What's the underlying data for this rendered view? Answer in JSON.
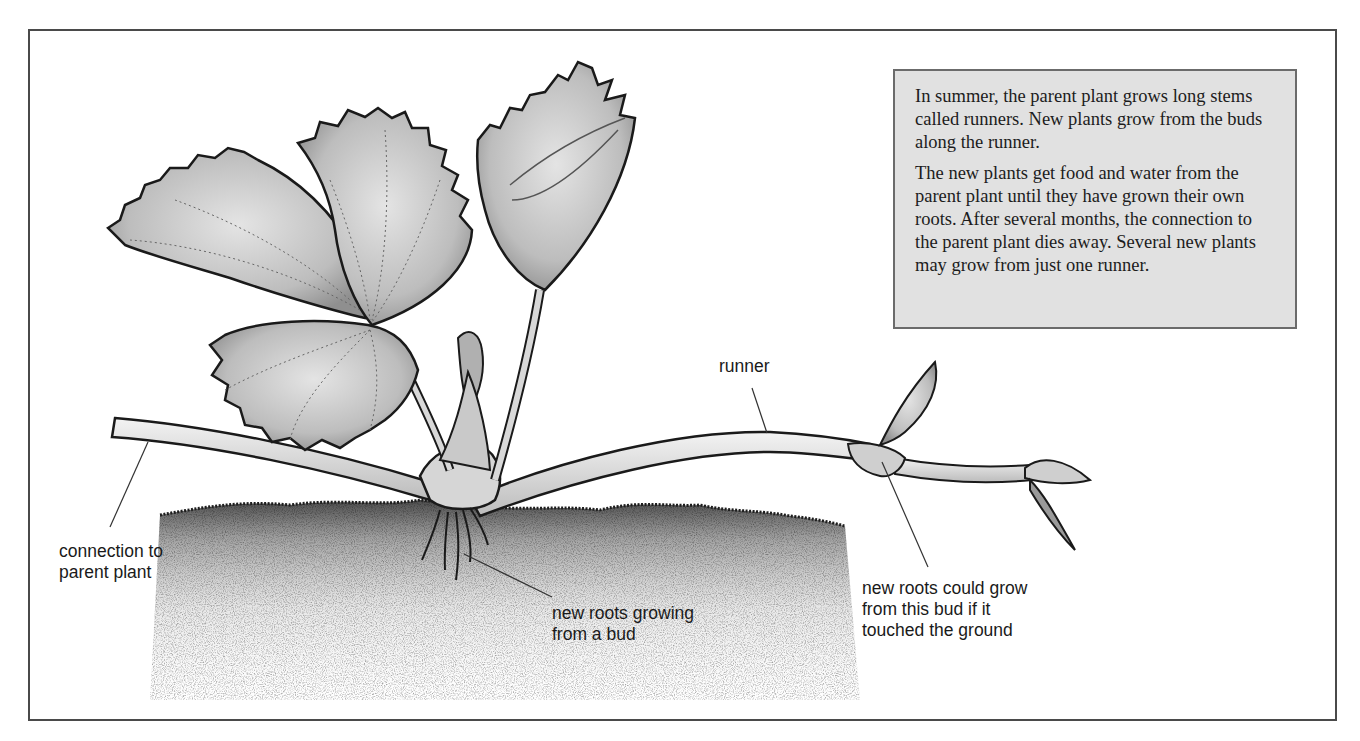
{
  "diagram": {
    "title_box": {
      "paragraphs": [
        "In summer, the parent plant grows long stems called runners. New plants grow from the buds along the runner.",
        "The new plants get food and water from the parent plant until they have grown their own roots. After several months, the connection to the parent plant dies away. Several new plants may grow from just one runner."
      ]
    },
    "labels": {
      "connection": "connection to\nparent plant",
      "runner": "runner",
      "roots_bud": "new roots growing\nfrom a bud",
      "could_grow": "new roots could grow\nfrom this bud if it\ntouched the ground"
    },
    "colors": {
      "frame_border": "#4a4a4a",
      "box_fill": "#e1e1e1",
      "box_border": "#6b6b6b",
      "leaf_fill": "#c8c8c8",
      "outline": "#1a1a1a",
      "soil": "#2a2a2a"
    }
  }
}
